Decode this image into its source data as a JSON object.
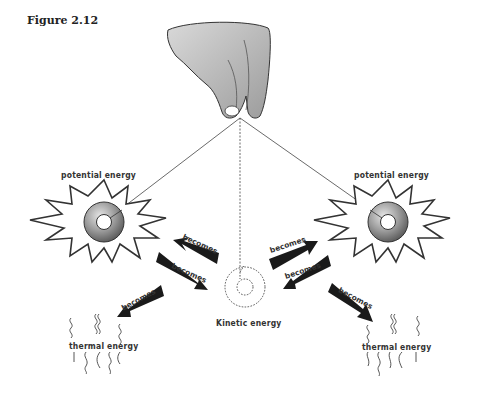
{
  "figure": {
    "title": "Figure 2.12"
  },
  "labels": {
    "potential_left": "potential energy",
    "potential_right": "potential energy",
    "kinetic": "Kinetic energy",
    "thermal_left": "thermal energy",
    "thermal_right": "thermal energy"
  },
  "arrows": [
    {
      "label": "becomes",
      "from": "kinetic",
      "to": "potential_left"
    },
    {
      "label": "becomes",
      "from": "potential_left",
      "to": "kinetic"
    },
    {
      "label": "becomes",
      "from": "potential_left",
      "to": "thermal_left"
    },
    {
      "label": "becomes",
      "from": "kinetic",
      "to": "potential_right"
    },
    {
      "label": "becomes",
      "from": "potential_right",
      "to": "kinetic"
    },
    {
      "label": "becomes",
      "from": "potential_right",
      "to": "thermal_right"
    }
  ],
  "colors": {
    "ink": "#222222",
    "disk_dark": "#6a6a6a",
    "disk_light": "#d8d8d8",
    "hand": "#bdbdbd"
  }
}
